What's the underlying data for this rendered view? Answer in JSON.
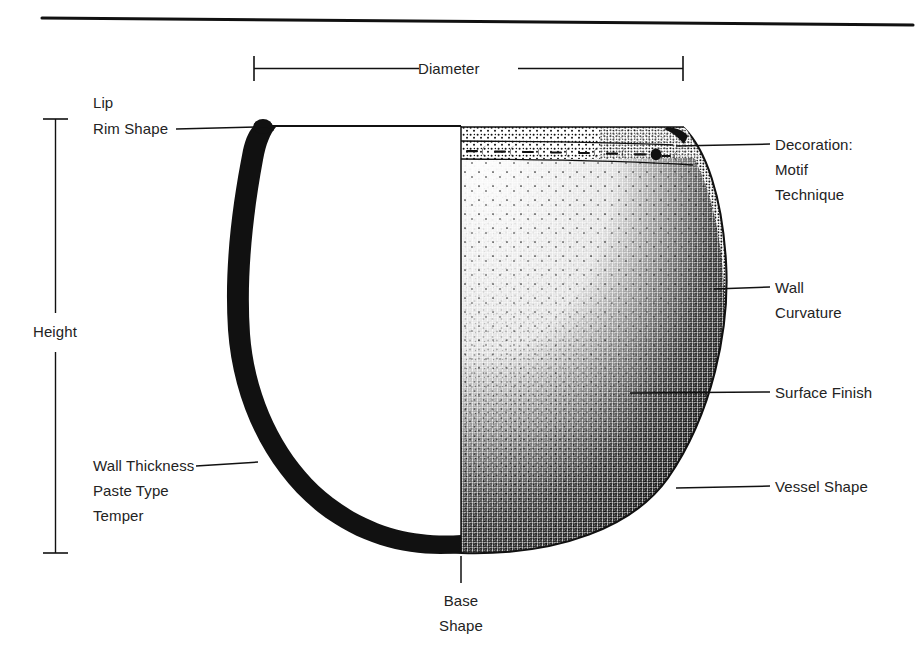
{
  "figure": {
    "ink_color": "#111111",
    "background_color": "#ffffff",
    "text_color": "#232323"
  },
  "rule": {
    "name": "top-horizontal-rule"
  },
  "dimensions": {
    "diameter": {
      "label": "Diameter",
      "orientation": "horizontal",
      "x_start": 253,
      "x_end": 684,
      "y": 68
    },
    "height": {
      "label": "Height",
      "orientation": "vertical",
      "x": 55,
      "y_start": 119,
      "y_end": 553
    }
  },
  "labels": {
    "lip": "Lip",
    "rim_shape": "Rim Shape",
    "wall_thickness": "Wall Thickness",
    "paste_type": "Paste Type",
    "temper": "Temper",
    "decoration": "Decoration:",
    "motif": "Motif",
    "technique": "Technique",
    "wall": "Wall",
    "curvature": "Curvature",
    "surface_finish": "Surface Finish",
    "vessel_shape": "Vessel Shape",
    "base": "Base",
    "shape": "Shape"
  },
  "vessel": {
    "centerline_x": 461,
    "rim_y": 125,
    "base_y": 553,
    "left_rim_x": 258,
    "right_rim_x": 684,
    "max_width_x": 726,
    "decoration_band": {
      "top_y": 128,
      "bottom_y": 160,
      "motif": "repeating crescent and dash band"
    },
    "section_half": "left",
    "exterior_half": "right"
  }
}
